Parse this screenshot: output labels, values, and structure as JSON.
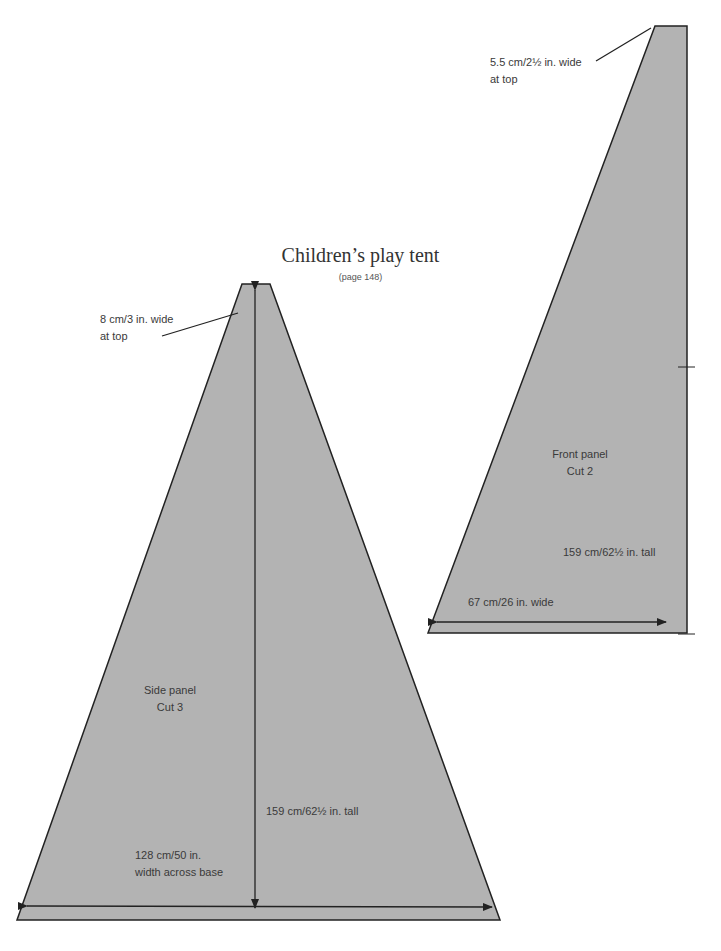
{
  "title": "Children’s play tent",
  "subtitle": "(page 148)",
  "colors": {
    "panel_fill": "#b3b3b3",
    "outline": "#222222",
    "text": "#3a3a3a"
  },
  "front_panel": {
    "name": "Front panel",
    "cut": "Cut 2",
    "top_label_line1": "5.5 cm/2½ in. wide",
    "top_label_line2": "at top",
    "height_label": "159 cm/62½ in. tall",
    "width_label": "67 cm/26 in. wide"
  },
  "side_panel": {
    "name": "Side panel",
    "cut": "Cut 3",
    "top_label_line1": "8 cm/3 in. wide",
    "top_label_line2": "at top",
    "height_label": "159 cm/62½ in. tall",
    "base_label_line1": "128 cm/50 in.",
    "base_label_line2": "width across base"
  }
}
